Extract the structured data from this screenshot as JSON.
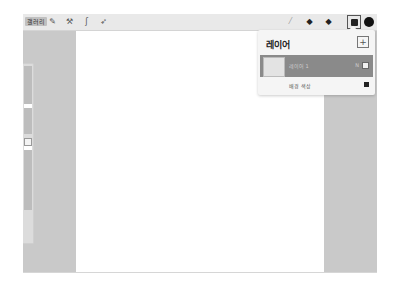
{
  "toolbar": {
    "gallery_label": "갤러리",
    "left_tools": [
      {
        "name": "actions",
        "icon": "wrench-icon",
        "glyph": "✎"
      },
      {
        "name": "adjustments",
        "icon": "magic-wand-icon",
        "glyph": "⚒"
      },
      {
        "name": "selection",
        "icon": "selection-icon",
        "glyph": "ʃ"
      },
      {
        "name": "transform",
        "icon": "arrow-icon",
        "glyph": "➶"
      }
    ],
    "right_tools": [
      {
        "name": "brush",
        "icon": "brush-icon",
        "glyph": "⁄"
      },
      {
        "name": "smudge",
        "icon": "smudge-icon",
        "glyph": "◆"
      },
      {
        "name": "eraser",
        "icon": "eraser-icon",
        "glyph": "◆"
      }
    ],
    "color": "#111111"
  },
  "layers_panel": {
    "title": "레이어",
    "add_glyph": "+",
    "layers": [
      {
        "name": "레이어 1",
        "blend_mode": "N",
        "visible": true
      }
    ],
    "background": {
      "name": "배경 색상",
      "color": "#222222"
    }
  }
}
